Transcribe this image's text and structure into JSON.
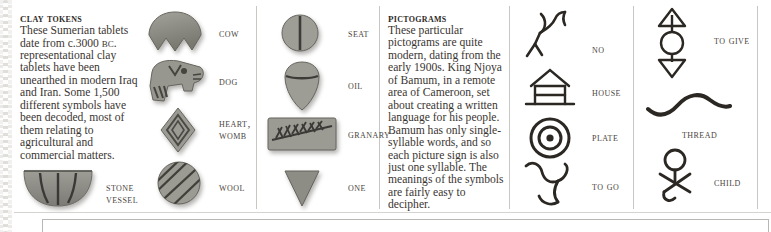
{
  "page": {
    "background_color": "#ffffff",
    "text_color": "#3a3531",
    "rule_color": "#c9c7c3",
    "clay_color": "#8b8a84",
    "ink_color": "#2b2723"
  },
  "clay_tokens": {
    "heading": "Clay tokens",
    "body_lines": [
      "These Sumerian tablets",
      "date from c.3000 BC.",
      "Large numbers of",
      "representational clay",
      "tablets have been",
      "unearthed in modern",
      "Iraq and Iran. Some",
      "1,500 different symbols",
      "have been decoded,",
      "most of them relating",
      "to agricultural and",
      "commercial matters."
    ],
    "body_text": "These Sumerian tablets date from c.3000 BC. Large numbers of representational clay tablets have been unearthed in modern Iraq and Iran. Some 1,500 different symbols have been decoded, most of them relating to agricultural and commercial matters.",
    "date_prefix_italic": "c.",
    "date_value": "3000",
    "date_era": "BC",
    "inline_token": {
      "label_line1": "Stone",
      "label_line2": "vessel",
      "shape": "stone-vessel"
    }
  },
  "token_column_one": [
    {
      "label": "Cow",
      "label2": "",
      "shape": "cow-token"
    },
    {
      "label": "Dog",
      "label2": "",
      "shape": "dog-token"
    },
    {
      "label": "Heart,",
      "label2": "womb",
      "shape": "heart-womb-token"
    },
    {
      "label": "Wool",
      "label2": "",
      "shape": "wool-token"
    }
  ],
  "token_column_two": [
    {
      "label": "Seat",
      "label2": "",
      "shape": "seat-token"
    },
    {
      "label": "Oil",
      "label2": "",
      "shape": "oil-token"
    },
    {
      "label": "Granary",
      "label2": "",
      "shape": "granary-token"
    },
    {
      "label": "One",
      "label2": "",
      "shape": "one-token"
    }
  ],
  "pictograms": {
    "heading": "Pictograms",
    "body_lines": [
      "These particular",
      "pictograms are quite",
      "modern, dating from",
      "the early 1900s. King",
      "Njoya of Bamum, in a",
      "remote area of",
      "Cameroon, set about",
      "creating a written",
      "language for his people.",
      "Bamum has only",
      "single- syllable words,",
      "and so each picture",
      "sign is also just one",
      "syllable. The meanings",
      "of the symbols are",
      "fairly easy to decipher."
    ],
    "body_text": "These particular pictograms are quite modern, dating from the early 1900s. King Njoya of Bamum, in a remote area of Cameroon, set about creating a written language for his people. Bamum has only single- syllable words, and so each picture sign is also just one syllable. The meanings of the symbols are fairly easy to decipher."
  },
  "pictogram_column_one": [
    {
      "label": "No",
      "shape": "no-pictogram"
    },
    {
      "label": "House",
      "shape": "house-pictogram"
    },
    {
      "label": "Plate",
      "shape": "plate-pictogram"
    },
    {
      "label": "To go",
      "shape": "to-go-pictogram"
    }
  ],
  "pictogram_column_two": [
    {
      "label": "To give",
      "shape": "to-give-pictogram"
    },
    {
      "label": "Thread",
      "shape": "thread-pictogram"
    },
    {
      "label": "Child",
      "shape": "child-pictogram"
    }
  ]
}
